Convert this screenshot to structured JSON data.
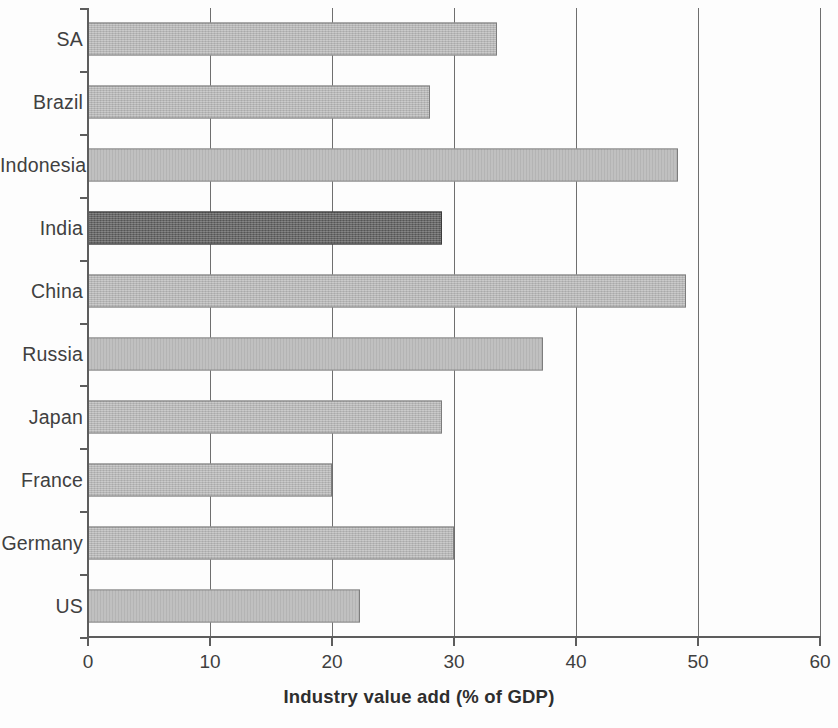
{
  "chart_data": {
    "type": "bar",
    "orientation": "horizontal",
    "title": "",
    "xlabel": "Industry value add (% of GDP)",
    "ylabel": "",
    "xlim": [
      0,
      60
    ],
    "xticks": [
      0,
      10,
      20,
      30,
      40,
      50,
      60
    ],
    "xtick_labels": [
      "0",
      "10",
      "20",
      "30",
      "40",
      "50",
      "60"
    ],
    "grid": "vertical",
    "legend": "none",
    "categories": [
      "SA",
      "Brazil",
      "Indonesia",
      "India",
      "China",
      "Russia",
      "Japan",
      "France",
      "Germany",
      "US"
    ],
    "values": [
      33.5,
      28.0,
      48.4,
      29.0,
      49.0,
      37.3,
      29.0,
      20.0,
      30.0,
      22.3
    ],
    "highlighted_category": "India",
    "colors": {
      "bar": "#b9b9b9",
      "bar_outline": "#7d7d7d",
      "bar_highlight": "#5c5c5c",
      "bar_highlight_outline": "#3d3d3d",
      "axis": "#5d5d5d",
      "gridline": "#6f6f6f",
      "text": "#3f3f3f",
      "background": "#fdfdfd"
    },
    "bars": [
      {
        "category": "SA",
        "value": 33.5,
        "highlighted": false
      },
      {
        "category": "Brazil",
        "value": 28.0,
        "highlighted": false
      },
      {
        "category": "Indonesia",
        "value": 48.4,
        "highlighted": false
      },
      {
        "category": "India",
        "value": 29.0,
        "highlighted": true
      },
      {
        "category": "China",
        "value": 49.0,
        "highlighted": false
      },
      {
        "category": "Russia",
        "value": 37.3,
        "highlighted": false
      },
      {
        "category": "Japan",
        "value": 29.0,
        "highlighted": false
      },
      {
        "category": "France",
        "value": 20.0,
        "highlighted": false
      },
      {
        "category": "Germany",
        "value": 30.0,
        "highlighted": false
      },
      {
        "category": "US",
        "value": 22.3,
        "highlighted": false
      }
    ]
  }
}
